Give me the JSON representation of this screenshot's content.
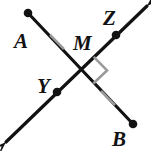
{
  "figure": {
    "type": "geometry-diagram",
    "width": 151,
    "height": 151,
    "background_color": "#ffffff",
    "stroke_color": "#121212",
    "mark_color": "#9a9a9a",
    "label_font_size": 21
  },
  "labels": {
    "a": "A",
    "b": "B",
    "m": "M",
    "y": "Y",
    "z": "Z"
  },
  "label_positions": {
    "a": {
      "x": 14,
      "y": 48
    },
    "b": {
      "x": 112,
      "y": 146
    },
    "m": {
      "x": 73,
      "y": 50
    },
    "y": {
      "x": 37,
      "y": 93
    },
    "z": {
      "x": 103,
      "y": 25
    }
  },
  "points": {
    "a": {
      "x": 28,
      "y": 13,
      "dot": true,
      "label": "A"
    },
    "b": {
      "x": 133,
      "y": 124,
      "dot": true,
      "label": "B"
    },
    "m": {
      "x": 80,
      "y": 70,
      "dot": false,
      "label": "M"
    },
    "y": {
      "x": 57,
      "y": 92,
      "dot": true,
      "label": "Y"
    },
    "z": {
      "x": 116,
      "y": 35,
      "dot": true,
      "label": "Z"
    }
  },
  "segments": [
    {
      "name": "segment-ab",
      "from": {
        "x": 28,
        "y": 13
      },
      "to": {
        "x": 133,
        "y": 124
      },
      "arrow_start": false,
      "arrow_end": false,
      "endpoint_dots": [
        "start",
        "end"
      ]
    },
    {
      "name": "line-yz",
      "from": {
        "x": 6,
        "y": 142
      },
      "to": {
        "x": 147,
        "y": 6
      },
      "arrow_start": true,
      "arrow_end": true,
      "endpoint_dots": []
    }
  ],
  "tick_marks": [
    {
      "name": "tick-segment-am",
      "x": 57,
      "y": 42,
      "angle_deg": 46,
      "length": 20
    },
    {
      "name": "tick-segment-mb",
      "x": 108,
      "y": 98,
      "angle_deg": 46,
      "length": 20
    }
  ],
  "right_angle": {
    "name": "right-angle-marker",
    "vertex": {
      "x": 80,
      "y": 70
    },
    "size": 19,
    "quadrant": "right"
  },
  "arrowheads": [
    {
      "name": "arrowhead-upper-right",
      "tip": {
        "x": 147,
        "y": 6
      },
      "direction_deg": -44
    },
    {
      "name": "arrowhead-lower-left",
      "tip": {
        "x": 6,
        "y": 142
      },
      "direction_deg": 136
    }
  ]
}
